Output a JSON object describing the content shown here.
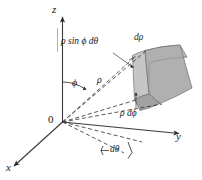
{
  "figure": {
    "background_color": "#ffffff",
    "line_color": "#3a3a3a",
    "solid_fill": "#b3b3b3",
    "solid_fill_light": "#c9c9c9",
    "solid_fill_dark": "#9e9e9e",
    "solid_stroke": "#6e6e6e"
  },
  "axes": {
    "x_label": "x",
    "y_label": "y",
    "z_label": "z"
  },
  "origin": {
    "label": "0"
  },
  "angles": {
    "phi_label": "ϕ",
    "theta_label": "dθ"
  },
  "radius": {
    "rho_label": "ρ"
  },
  "dimension_labels": {
    "arc_theta": "ρ sin ϕ dθ",
    "d_rho": "dρ",
    "rho_d_phi": "ρ dϕ"
  }
}
